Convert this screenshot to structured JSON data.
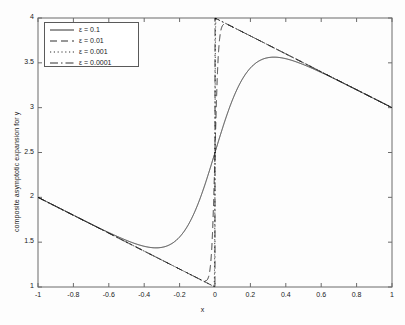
{
  "chart_data": {
    "type": "line",
    "title": "",
    "xlabel": "x",
    "ylabel": "composite asymptotic expansion for y",
    "xlim": [
      -1,
      1
    ],
    "ylim": [
      1,
      4
    ],
    "xticks": [
      -1,
      -0.8,
      -0.6,
      -0.4,
      -0.2,
      0,
      0.2,
      0.4,
      0.6,
      0.8,
      1
    ],
    "xticklabels": [
      "-1",
      "-0.8",
      "-0.6",
      "-0.4",
      "-0.2",
      "0",
      "0.2",
      "0.4",
      "0.6",
      "0.8",
      "1"
    ],
    "yticks": [
      1,
      1.5,
      2,
      2.5,
      3,
      3.5,
      4
    ],
    "yticklabels": [
      "1",
      "1.5",
      "2",
      "2.5",
      "3",
      "3.5",
      "4"
    ],
    "grid": false,
    "legend_position": "upper left",
    "line_color": "#1a1a1a",
    "series": [
      {
        "name": "eps-0.1",
        "label": "ε = 0.1",
        "epsilon": 0.1,
        "style": "solid",
        "dash": "none"
      },
      {
        "name": "eps-0.01",
        "label": "ε = 0.01",
        "epsilon": 0.01,
        "style": "dashed",
        "dash": "7,4"
      },
      {
        "name": "eps-0.001",
        "label": "ε = 0.001",
        "epsilon": 0.001,
        "style": "dotted",
        "dash": "1.2,2.6"
      },
      {
        "name": "eps-0.0001",
        "label": "ε = 0.0001",
        "epsilon": 0.0001,
        "style": "dashdot",
        "dash": "8,3,1.5,3"
      }
    ],
    "annotations": [
      "All curves pass through approximately (0, 2.5)",
      "Outer solution slope -1; left branch from (-1, 2), right branch to (1, 3)",
      "Interior layer at x = 0 of width proportional to epsilon",
      "Solid curve (eps=0.1) has minimum near (-0.4, 1.51) and maximum near (0.41, 3.49)"
    ]
  },
  "legend": {
    "entries": [
      {
        "label": "ε = 0.1"
      },
      {
        "label": "ε = 0.01"
      },
      {
        "label": "ε = 0.001"
      },
      {
        "label": "ε = 0.0001"
      }
    ]
  }
}
